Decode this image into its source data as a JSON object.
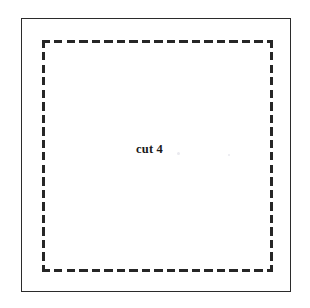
{
  "figure": {
    "label": "cut 4",
    "width": 310,
    "height": 308,
    "background_color": "#ffffff"
  },
  "outer_rect": {
    "name": "sheet-outline",
    "style": "solid",
    "stroke_color": "#2b2b2b",
    "stroke_width": 1.6,
    "x": 21,
    "y": 18,
    "width": 270,
    "height": 274
  },
  "dashed_rect": {
    "name": "cut-line",
    "style": "dashed",
    "stroke_color": "#262626",
    "stroke_width": 3,
    "dash_length": 8,
    "dash_gap": 4.5,
    "x": 42,
    "y": 40,
    "width": 231,
    "height": 232
  },
  "annotations": [
    {
      "text": "cut 4",
      "x": 136,
      "y": 143,
      "font_weight": "bold",
      "font_size": 12.5,
      "color": "#1a1a1a"
    }
  ]
}
